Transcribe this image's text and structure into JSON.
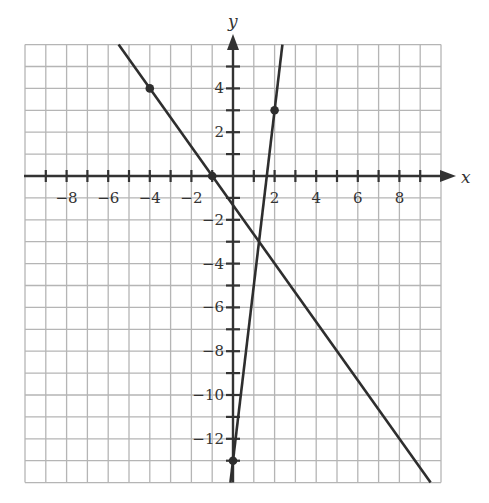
{
  "chart_data": {
    "type": "line",
    "title": "",
    "xlabel": "x",
    "ylabel": "y",
    "xlim": [
      -10,
      10
    ],
    "ylim": [
      -14,
      6
    ],
    "grid": true,
    "grid_step": 1,
    "x_tick_labels": [
      {
        "value": -8,
        "label": "−8"
      },
      {
        "value": -6,
        "label": "−6"
      },
      {
        "value": -4,
        "label": "−4"
      },
      {
        "value": -2,
        "label": "−2"
      },
      {
        "value": 2,
        "label": "2"
      },
      {
        "value": 4,
        "label": "4"
      },
      {
        "value": 6,
        "label": "6"
      },
      {
        "value": 8,
        "label": "8"
      }
    ],
    "y_tick_labels": [
      {
        "value": 4,
        "label": "4"
      },
      {
        "value": 2,
        "label": "2"
      },
      {
        "value": -2,
        "label": "−2"
      },
      {
        "value": -4,
        "label": "−4"
      },
      {
        "value": -6,
        "label": "−6"
      },
      {
        "value": -8,
        "label": "−8"
      },
      {
        "value": -10,
        "label": "−10"
      },
      {
        "value": -12,
        "label": "−12"
      }
    ],
    "series": [
      {
        "name": "line 1",
        "equation": "y = -4/3 x - 4/3",
        "slope": -1.3333,
        "intercept": -1.3333,
        "x": [
          -5.5,
          9.5
        ],
        "y": [
          6,
          -14
        ],
        "marked_points": [
          [
            -4,
            4
          ],
          [
            -1,
            0
          ]
        ]
      },
      {
        "name": "line 2",
        "equation": "y = 8x - 13",
        "slope": 8,
        "intercept": -13,
        "x": [
          2.375,
          -0.125
        ],
        "y": [
          6,
          -14
        ],
        "marked_points": [
          [
            2,
            3
          ],
          [
            0,
            -13
          ]
        ]
      }
    ],
    "intersection": [
      1.25,
      -3
    ],
    "legend": null
  },
  "colors": {
    "grid": "#b5b5b5",
    "axis": "#333333",
    "line": "#2e2e2e",
    "text": "#333333"
  }
}
